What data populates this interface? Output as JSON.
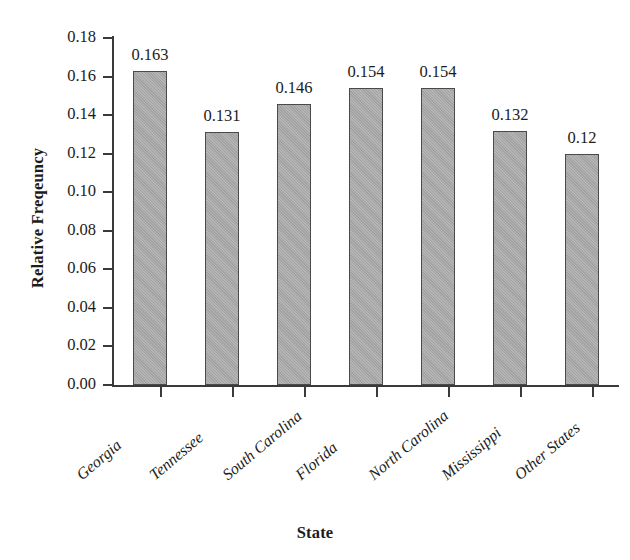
{
  "chart_data": {
    "type": "bar",
    "title": "",
    "xlabel": "State",
    "ylabel": "Relative Freqeuncy",
    "categories": [
      "Georgia",
      "Tennessee",
      "South Carolina",
      "Florida",
      "North Carolina",
      "Mississippi",
      "Other States"
    ],
    "values": [
      0.163,
      0.131,
      0.146,
      0.154,
      0.154,
      0.132,
      0.12
    ],
    "value_labels": [
      "0.163",
      "0.131",
      "0.146",
      "0.154",
      "0.154",
      "0.132",
      "0.12"
    ],
    "ylim": [
      0.0,
      0.18
    ],
    "ytick_values": [
      0.18,
      0.16,
      0.14,
      0.12,
      0.1,
      0.08,
      0.06,
      0.04,
      0.02,
      0.0
    ],
    "ytick_labels": [
      "0.18",
      "0.16",
      "0.14",
      "0.12",
      "0.10",
      "0.08",
      "0.06",
      "0.04",
      "0.02",
      "0.00"
    ],
    "grid": false,
    "legend": false,
    "bar_color": "#a9a9a9",
    "bar_border_color": "#4a4a4a",
    "axis_color": "#3a3a3a",
    "background_color": "#ffffff"
  }
}
